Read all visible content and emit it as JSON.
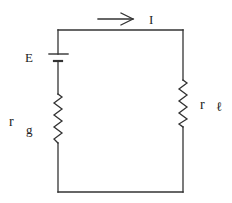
{
  "diagram": {
    "type": "circuit",
    "title": "",
    "colors": {
      "line": "#333333",
      "text": "#222222",
      "background": "#ffffff"
    },
    "components": {
      "battery": {
        "label": "E"
      },
      "internal_resistor": {
        "label": "r",
        "subscript": "g"
      },
      "load_resistor": {
        "label": "r",
        "subscript": "ℓ"
      },
      "current_arrow": {
        "label": "I",
        "direction": "right"
      }
    }
  }
}
